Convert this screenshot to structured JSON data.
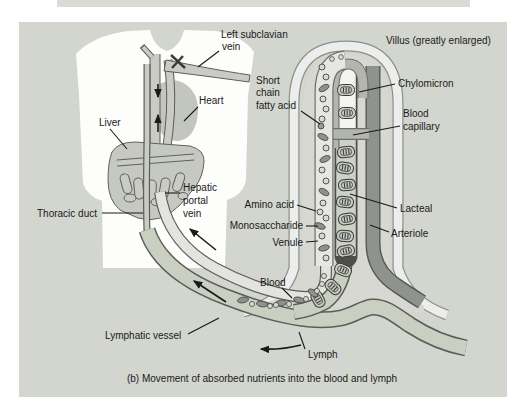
{
  "figure": {
    "caption": "(b) Movement of absorbed nutrients into the blood and lymph"
  },
  "labels": {
    "left_subclavian_vein": [
      "Left subclavian",
      "vein"
    ],
    "villus": "Villus (greatly enlarged)",
    "short_chain_fatty_acid": [
      "Short",
      "chain",
      "fatty acid"
    ],
    "heart": "Heart",
    "chylomicron": "Chylomicron",
    "liver": "Liver",
    "blood_capillary": [
      "Blood",
      "capillary"
    ],
    "hepatic_portal_vein": [
      "Hepatic",
      "portal",
      "vein"
    ],
    "amino_acid": "Amino acid",
    "lacteal": "Lacteal",
    "monosaccharide": "Monosaccharide",
    "arteriole": "Arteriole",
    "venule": "Venule",
    "thoracic_duct": "Thoracic duct",
    "blood": "Blood",
    "lymphatic_vessel": "Lymphatic vessel",
    "lymph": "Lymph"
  },
  "colors": {
    "panel_background": "#d3d5cf",
    "torso": "#fdfdfb",
    "organ_gray": "#c6c8c2",
    "vessel_fill": "#c9cbc5",
    "vessel_outline": "#5d5d57",
    "blood_vessel_interior": "#e3e4e0",
    "lymph_fill": "#c9cfc1",
    "arteriole_fill": "#8e938d",
    "lacteal_lower_fill": "#ccd2c6",
    "villus_outer_band": "#eceded",
    "text": "#1a1a1a"
  }
}
